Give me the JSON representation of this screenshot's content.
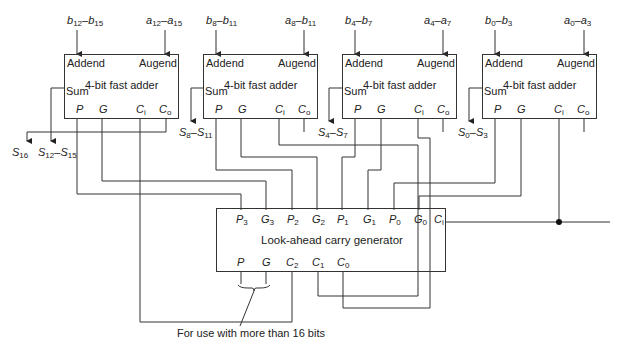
{
  "diagram": {
    "adders": [
      {
        "id": "adder-3",
        "title": "4-bit fast adder",
        "addend_label": "Addend",
        "augend_label": "Augend",
        "sum_label": "Sum",
        "pins": [
          "P",
          "G",
          "C",
          "C"
        ],
        "pin_subs": [
          "",
          "",
          "i",
          "o"
        ],
        "addend_in": {
          "base1": "b",
          "sub1": "12",
          "base2": "b",
          "sub2": "15"
        },
        "augend_in": {
          "base1": "a",
          "sub1": "12",
          "base2": "a",
          "sub2": "15"
        },
        "sum_out": {
          "base1": "S",
          "sub1": "12",
          "base2": "S",
          "sub2": "15"
        }
      },
      {
        "id": "adder-2",
        "title": "4-bit fast adder",
        "addend_label": "Addend",
        "augend_label": "Augend",
        "sum_label": "Sum",
        "pins": [
          "P",
          "G",
          "C",
          "C"
        ],
        "pin_subs": [
          "",
          "",
          "i",
          "o"
        ],
        "addend_in": {
          "base1": "b",
          "sub1": "8",
          "base2": "b",
          "sub2": "11"
        },
        "augend_in": {
          "base1": "a",
          "sub1": "8",
          "base2": "b",
          "sub2": "11"
        },
        "sum_out": {
          "base1": "S",
          "sub1": "8",
          "base2": "S",
          "sub2": "11"
        }
      },
      {
        "id": "adder-1",
        "title": "4-bit fast adder",
        "addend_label": "Addend",
        "augend_label": "Augend",
        "sum_label": "Sum",
        "pins": [
          "P",
          "G",
          "C",
          "C"
        ],
        "pin_subs": [
          "",
          "",
          "i",
          "o"
        ],
        "addend_in": {
          "base1": "b",
          "sub1": "4",
          "base2": "b",
          "sub2": "7"
        },
        "augend_in": {
          "base1": "a",
          "sub1": "4",
          "base2": "a",
          "sub2": "7"
        },
        "sum_out": {
          "base1": "S",
          "sub1": "4",
          "base2": "S",
          "sub2": "7"
        }
      },
      {
        "id": "adder-0",
        "title": "4-bit fast adder",
        "addend_label": "Addend",
        "augend_label": "Augend",
        "sum_label": "Sum",
        "pins": [
          "P",
          "G",
          "C",
          "C"
        ],
        "pin_subs": [
          "",
          "",
          "i",
          "o"
        ],
        "addend_in": {
          "base1": "b",
          "sub1": "0",
          "base2": "b",
          "sub2": "3"
        },
        "augend_in": {
          "base1": "a",
          "sub1": "0",
          "base2": "a",
          "sub2": "3"
        },
        "sum_out": {
          "base1": "S",
          "sub1": "0",
          "base2": "S",
          "sub2": "3"
        }
      }
    ],
    "carry_out": {
      "base": "S",
      "sub": "16"
    },
    "lookahead": {
      "title": "Look-ahead carry generator",
      "top_pins": [
        {
          "base": "P",
          "sub": "3"
        },
        {
          "base": "G",
          "sub": "3"
        },
        {
          "base": "P",
          "sub": "2"
        },
        {
          "base": "G",
          "sub": "2"
        },
        {
          "base": "P",
          "sub": "1"
        },
        {
          "base": "G",
          "sub": "1"
        },
        {
          "base": "P",
          "sub": "0"
        },
        {
          "base": "G",
          "sub": "0"
        },
        {
          "base": "C",
          "sub": "i"
        }
      ],
      "bottom_pins": [
        {
          "base": "P",
          "sub": ""
        },
        {
          "base": "G",
          "sub": ""
        },
        {
          "base": "C",
          "sub": "2"
        },
        {
          "base": "C",
          "sub": "1"
        },
        {
          "base": "C",
          "sub": "0"
        }
      ]
    },
    "note": "For use with more than 16 bits",
    "colors": {
      "line": "#333333",
      "background": "#ffffff",
      "junction": "#111111"
    }
  }
}
